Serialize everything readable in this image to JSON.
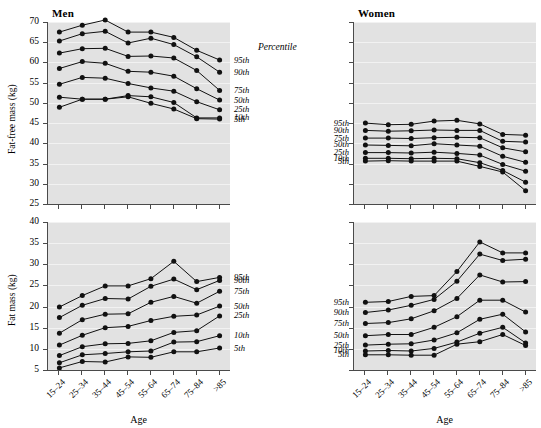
{
  "figure": {
    "percentile_header": "Percentile",
    "percentile_names": [
      "95th",
      "90th",
      "75th",
      "50th",
      "25th",
      "10th",
      "5th"
    ],
    "columns": [
      "Men",
      "Women"
    ],
    "rows": [
      "Fat-free mass (kg)",
      "Fat mass (kg)"
    ],
    "xlabel": "Age",
    "age_groups": [
      "15–24",
      "25–34",
      "35–44",
      "45–54",
      "55–64",
      "65–74",
      "75–84",
      ">85"
    ],
    "marker_color": "#111111",
    "line_color": "#111111",
    "plot_background": "#e2e2e2",
    "grid_color": "#f2f2f2",
    "axis_color": "#4a4a4a"
  },
  "chart_data": [
    {
      "type": "line",
      "title": "Men",
      "xlabel": "Age",
      "ylabel": "Fat-free mass (kg)",
      "ylim": [
        25,
        70
      ],
      "yticks": [
        25,
        30,
        35,
        40,
        45,
        50,
        55,
        60,
        65,
        70
      ],
      "grid": true,
      "legend_position": "right",
      "categories": [
        "15–24",
        "25–34",
        "35–44",
        "45–54",
        "55–64",
        "65–74",
        "75–84",
        ">85"
      ],
      "series": [
        {
          "name": "95th",
          "values": [
            67.5,
            69.2,
            70.5,
            67.5,
            67.5,
            66.2,
            63.0,
            60.6
          ]
        },
        {
          "name": "90th",
          "values": [
            65.3,
            67.1,
            67.7,
            64.8,
            66.0,
            64.4,
            61.4,
            57.6
          ]
        },
        {
          "name": "75th",
          "values": [
            62.3,
            63.4,
            63.5,
            61.5,
            61.6,
            61.1,
            58.0,
            53.1
          ]
        },
        {
          "name": "50th",
          "values": [
            58.5,
            60.2,
            59.8,
            57.8,
            57.6,
            56.6,
            53.5,
            50.7
          ]
        },
        {
          "name": "25th",
          "values": [
            54.6,
            56.3,
            56.1,
            54.8,
            53.7,
            52.9,
            50.3,
            48.3
          ]
        },
        {
          "name": "10th",
          "values": [
            51.4,
            50.9,
            50.9,
            51.8,
            51.5,
            50.1,
            46.3,
            46.3
          ]
        },
        {
          "name": "5th",
          "values": [
            48.9,
            50.9,
            50.9,
            51.5,
            49.9,
            48.5,
            46.1,
            46.0
          ]
        }
      ]
    },
    {
      "type": "line",
      "title": "Women",
      "xlabel": "Age",
      "ylabel": "Fat-free mass (kg)",
      "ylim": [
        25,
        70
      ],
      "yticks": [
        25,
        30,
        35,
        40,
        45,
        50,
        55,
        60,
        65,
        70
      ],
      "grid": true,
      "legend_position": "left",
      "categories": [
        "15–24",
        "25–34",
        "35–44",
        "45–54",
        "55–64",
        "65–74",
        "75–84",
        ">85"
      ],
      "series": [
        {
          "name": "95th",
          "values": [
            45.0,
            44.6,
            44.7,
            45.5,
            45.7,
            44.8,
            42.2,
            42.0
          ]
        },
        {
          "name": "90th",
          "values": [
            43.2,
            43.0,
            43.1,
            43.3,
            43.2,
            43.2,
            40.5,
            40.3
          ]
        },
        {
          "name": "75th",
          "values": [
            41.3,
            41.3,
            41.2,
            41.4,
            41.5,
            41.4,
            38.9,
            37.9
          ]
        },
        {
          "name": "50th",
          "values": [
            39.6,
            39.5,
            39.4,
            39.9,
            39.6,
            39.3,
            36.8,
            35.3
          ]
        },
        {
          "name": "25th",
          "values": [
            37.7,
            37.7,
            37.6,
            37.8,
            37.5,
            37.1,
            34.8,
            33.1
          ]
        },
        {
          "name": "10th",
          "values": [
            36.3,
            36.3,
            36.2,
            36.3,
            36.2,
            35.2,
            33.3,
            30.4
          ]
        },
        {
          "name": "5th",
          "values": [
            35.6,
            35.7,
            35.6,
            35.6,
            35.6,
            34.3,
            32.9,
            28.3
          ]
        }
      ]
    },
    {
      "type": "line",
      "title": "Men",
      "xlabel": "Age",
      "ylabel": "Fat mass (kg)",
      "ylim": [
        5,
        40
      ],
      "yticks": [
        5,
        10,
        15,
        20,
        25,
        30,
        35,
        40
      ],
      "grid": true,
      "legend_position": "right",
      "categories": [
        "15–24",
        "25–34",
        "35–44",
        "45–54",
        "55–64",
        "65–74",
        "75–84",
        ">85"
      ],
      "series": [
        {
          "name": "95th",
          "values": [
            19.9,
            22.6,
            24.9,
            24.9,
            26.6,
            30.7,
            25.9,
            26.9
          ]
        },
        {
          "name": "90th",
          "values": [
            17.4,
            20.3,
            21.9,
            21.8,
            24.8,
            26.5,
            24.0,
            26.2
          ]
        },
        {
          "name": "75th",
          "values": [
            13.7,
            16.9,
            18.2,
            18.3,
            21.0,
            22.4,
            20.8,
            23.6
          ]
        },
        {
          "name": "50th",
          "values": [
            10.9,
            13.2,
            15.0,
            15.3,
            16.7,
            17.7,
            18.0,
            20.1
          ]
        },
        {
          "name": "25th",
          "values": [
            8.4,
            10.5,
            11.2,
            11.3,
            11.9,
            13.9,
            14.3,
            17.8
          ]
        },
        {
          "name": "10th",
          "values": [
            6.7,
            8.6,
            8.9,
            9.3,
            9.5,
            11.6,
            11.7,
            13.1
          ]
        },
        {
          "name": "5th",
          "values": [
            5.5,
            7.0,
            6.9,
            8.1,
            8.0,
            9.3,
            9.3,
            10.2
          ]
        }
      ]
    },
    {
      "type": "line",
      "title": "Women",
      "xlabel": "Age",
      "ylabel": "Fat mass (kg)",
      "ylim": [
        5,
        40
      ],
      "yticks": [
        5,
        10,
        15,
        20,
        25,
        30,
        35,
        40
      ],
      "grid": true,
      "legend_position": "left",
      "categories": [
        "15–24",
        "25–34",
        "35–44",
        "45–54",
        "55–64",
        "65–74",
        "75–84",
        ">85"
      ],
      "series": [
        {
          "name": "95th",
          "values": [
            21.0,
            21.2,
            22.4,
            22.6,
            28.3,
            35.3,
            32.7,
            32.7
          ]
        },
        {
          "name": "90th",
          "values": [
            18.6,
            19.2,
            20.3,
            21.7,
            26.0,
            32.4,
            30.9,
            31.2
          ]
        },
        {
          "name": "75th",
          "values": [
            16.0,
            16.2,
            17.1,
            19.0,
            21.9,
            27.5,
            25.8,
            25.9
          ]
        },
        {
          "name": "50th",
          "values": [
            13.1,
            13.4,
            13.4,
            15.1,
            17.6,
            21.5,
            21.5,
            18.7
          ]
        },
        {
          "name": "25th",
          "values": [
            10.9,
            11.1,
            11.2,
            12.1,
            13.8,
            17.0,
            18.2,
            14.0
          ]
        },
        {
          "name": "10th",
          "values": [
            9.5,
            9.6,
            9.5,
            10.1,
            11.6,
            13.7,
            15.1,
            11.4
          ]
        },
        {
          "name": "5th",
          "values": [
            8.6,
            8.6,
            8.5,
            8.5,
            11.1,
            11.7,
            13.4,
            10.8
          ]
        }
      ]
    }
  ]
}
